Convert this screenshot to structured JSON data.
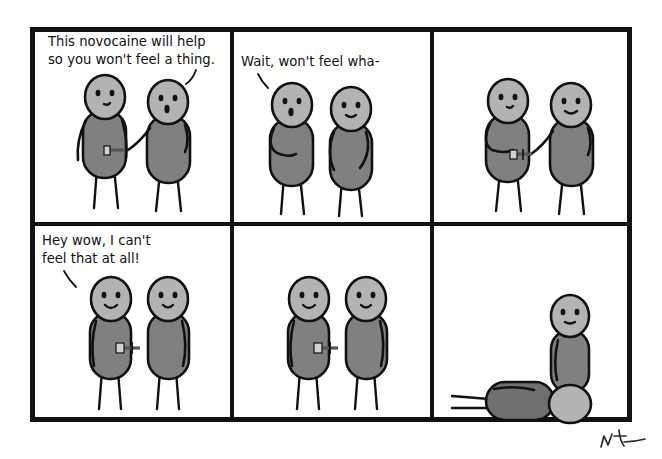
{
  "comic": {
    "title": "Novocaine comic strip",
    "layout": {
      "columns": 3,
      "rows": 2,
      "panel_count": 6
    },
    "colors": {
      "background": "#ffffff",
      "ink": "#111111",
      "head_fill": "#b3b3b3",
      "body_fill": "#808080",
      "body_fill_dark": "#6f6f6f",
      "needle_plunger": "#d0d0d0",
      "needle_shaft": "#555555"
    },
    "frame": {
      "x": 30,
      "y": 27,
      "width": 602,
      "height": 395,
      "outer_stroke": 5,
      "divider_stroke": 4,
      "col_divider_x": [
        232,
        432
      ],
      "row_divider_y": [
        224
      ]
    },
    "panels": [
      {
        "id": "panel-1",
        "index": 1,
        "caption_lines": [
          "This novocaine will help",
          "so you won't feel a thing."
        ],
        "speaker": "right-figure",
        "description": "Doctor on the right reaches out with a syringe toward the patient on the left",
        "has_tail": true
      },
      {
        "id": "panel-2",
        "index": 2,
        "caption_lines": [
          "Wait, won't feel wha-"
        ],
        "speaker": "left-figure",
        "description": "Patient on the left speaks with a worried frown, doctor stands with arms down",
        "has_tail": true
      },
      {
        "id": "panel-3",
        "index": 3,
        "caption_lines": [],
        "speaker": null,
        "description": "Doctor injects the syringe into the patient's torso",
        "has_tail": false
      },
      {
        "id": "panel-4",
        "index": 4,
        "caption_lines": [
          "Hey wow, I can't",
          "feel that at all!"
        ],
        "speaker": "left-figure",
        "description": "Patient smiles with the needle still stuck in his torso",
        "has_tail": true
      },
      {
        "id": "panel-5",
        "index": 5,
        "caption_lines": [],
        "speaker": null,
        "description": "Both figures stand smiling, needle still in the patient",
        "has_tail": false
      },
      {
        "id": "panel-6",
        "index": 6,
        "caption_lines": [],
        "speaker": null,
        "description": "One figure stands alone while the other has collapsed flat on the ground",
        "has_tail": false
      }
    ],
    "signature": {
      "present": true,
      "position": "bottom-right",
      "label": "artist-signature"
    }
  }
}
